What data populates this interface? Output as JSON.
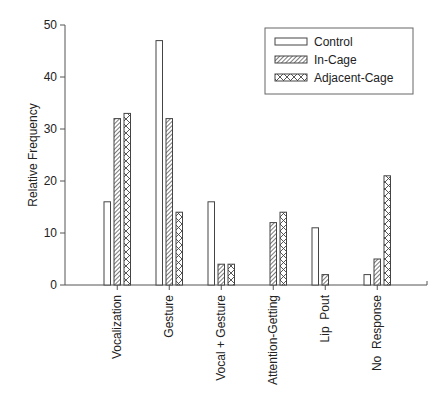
{
  "chart_data": {
    "type": "bar",
    "title": "",
    "xlabel": "",
    "ylabel": "Relative Frequency",
    "ylim": [
      0,
      50
    ],
    "yticks": [
      0,
      10,
      20,
      30,
      40,
      50
    ],
    "grid": false,
    "legend_position": "upper right",
    "categories": [
      "Vocalization",
      "Gesture",
      "Vocal + Gesture",
      "Attention-Getting",
      "Lip  Pout",
      "No  Response"
    ],
    "series": [
      {
        "name": "Control",
        "pattern": "empty",
        "values": [
          16,
          47,
          16,
          0,
          11,
          2
        ]
      },
      {
        "name": "In-Cage",
        "pattern": "diagonal-hatch",
        "values": [
          32,
          32,
          4,
          12,
          2,
          5
        ]
      },
      {
        "name": "Adjacent-Cage",
        "pattern": "cross-hatch",
        "values": [
          33,
          14,
          4,
          14,
          0,
          21
        ]
      }
    ]
  },
  "colors": {
    "axis": "#555555",
    "bar_stroke": "#444444",
    "fill": "#ffffff"
  }
}
